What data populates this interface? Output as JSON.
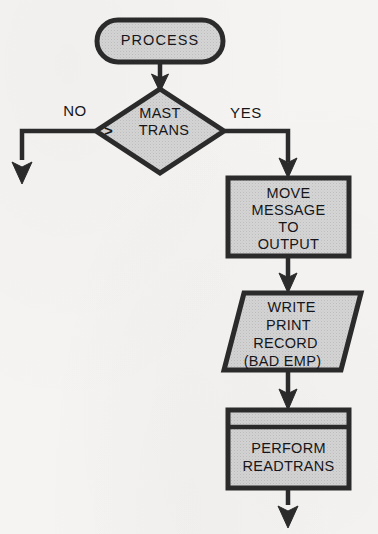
{
  "diagram": {
    "type": "flowchart",
    "colors": {
      "background": "#f5f4f2",
      "node_fill": "#d3d3d3",
      "node_stroke": "#2b2b2b",
      "text": "#16161a",
      "connector": "#2b2b2b"
    },
    "nodes": [
      {
        "id": "process",
        "shape": "terminator",
        "label": "PROCESS",
        "lines": [
          "PROCESS"
        ]
      },
      {
        "id": "decision",
        "shape": "diamond",
        "label": "MAST > TRANS",
        "lines": [
          "MAST",
          "TRANS"
        ],
        "operator": ">"
      },
      {
        "id": "move",
        "shape": "process",
        "label": "MOVE MESSAGE TO OUTPUT",
        "lines": [
          "MOVE",
          "MESSAGE",
          "TO",
          "OUTPUT"
        ]
      },
      {
        "id": "write",
        "shape": "parallelogram",
        "label": "WRITE PRINT RECORD (BAD EMP)",
        "lines": [
          "WRITE",
          "PRINT",
          "RECORD",
          "(BAD EMP)"
        ]
      },
      {
        "id": "perform",
        "shape": "predefined-process",
        "label": "PERFORM READTRANS",
        "lines": [
          "PERFORM",
          "READTRANS"
        ]
      }
    ],
    "branches": [
      {
        "id": "no",
        "label": "NO",
        "from": "decision",
        "direction": "left-down"
      },
      {
        "id": "yes",
        "label": "YES",
        "from": "decision",
        "direction": "right-down"
      }
    ],
    "connectors": [
      {
        "id": "process-to-decision",
        "from": "process",
        "to": "decision",
        "arrow": true
      },
      {
        "id": "decision-no-exit",
        "from": "decision",
        "to": "exit-left",
        "arrow": true
      },
      {
        "id": "decision-yes-to-move",
        "from": "decision",
        "to": "move",
        "arrow": true
      },
      {
        "id": "move-to-write",
        "from": "move",
        "to": "write",
        "arrow": true
      },
      {
        "id": "write-to-perform",
        "from": "write",
        "to": "perform",
        "arrow": true
      },
      {
        "id": "perform-to-exit",
        "from": "perform",
        "to": "exit-bottom",
        "arrow": true
      }
    ]
  }
}
